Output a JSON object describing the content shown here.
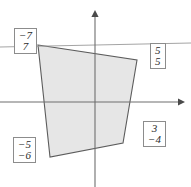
{
  "figure": {
    "title": "",
    "background_color": "#ffffff",
    "width": 191,
    "height": 187
  },
  "axes": {
    "origin": {
      "x": 95,
      "y": 102
    },
    "x_axis": {
      "x_start": 0,
      "x_end": 180,
      "y": 102,
      "arrow": "right",
      "color": "#6e6e6e"
    },
    "y_axis": {
      "y_start": 13,
      "y_end": 187,
      "x": 95,
      "arrow": "up",
      "color": "#6e6e6e"
    },
    "show_ticks": false,
    "show_grid": false
  },
  "guide_line": {
    "name": "upper-boundary-line",
    "x1": 0,
    "y1": 47,
    "x2": 191,
    "y2": 43,
    "color": "#9a9a9a"
  },
  "polygon": {
    "name": "shaded-quadrilateral",
    "fill_color": "#e6e6e6",
    "stroke_color": "#5c5c5c",
    "points_px": [
      {
        "x": 38,
        "y": 45
      },
      {
        "x": 137,
        "y": 60
      },
      {
        "x": 123,
        "y": 143
      },
      {
        "x": 50,
        "y": 157
      }
    ]
  },
  "labels": [
    {
      "id": "top-left",
      "name": "vector-label-top-left",
      "entries": [
        "−7",
        "7"
      ]
    },
    {
      "id": "right",
      "name": "vector-label-right",
      "entries": [
        "5",
        "5"
      ]
    },
    {
      "id": "bottom-right",
      "name": "vector-label-bottom-right",
      "entries": [
        "3",
        "−4"
      ]
    },
    {
      "id": "bottom-left",
      "name": "vector-label-bottom-left",
      "entries": [
        "−5",
        "−6"
      ]
    }
  ]
}
